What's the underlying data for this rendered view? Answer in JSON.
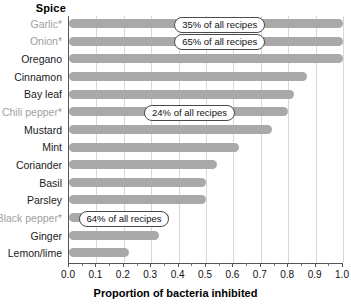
{
  "chart_data": {
    "type": "bar",
    "orientation": "horizontal",
    "title": "",
    "xlabel": "Proportion of bacteria inhibited",
    "ylabel": "Spice",
    "xlim": [
      0.0,
      1.0
    ],
    "xticks": [
      "0.0",
      "0.1",
      "0.2",
      "0.3",
      "0.4",
      "0.5",
      "0.6",
      "0.7",
      "0.8",
      "0.9",
      "1.0"
    ],
    "grid": true,
    "legend": "none",
    "bar_color": "#a9a9a9",
    "muted_label_color": "#a0a0a0",
    "categories": [
      "Garlic*",
      "Onion*",
      "Oregano",
      "Cinnamon",
      "Bay leaf",
      "Chili pepper*",
      "Mustard",
      "Mint",
      "Coriander",
      "Basil",
      "Parsley",
      "Black pepper*",
      "Ginger",
      "Lemon/lime"
    ],
    "values": [
      1.0,
      1.0,
      1.0,
      0.87,
      0.82,
      0.8,
      0.74,
      0.62,
      0.54,
      0.5,
      0.5,
      0.365,
      0.33,
      0.22
    ],
    "muted": [
      true,
      true,
      false,
      false,
      false,
      true,
      false,
      false,
      false,
      false,
      false,
      true,
      false,
      false
    ],
    "annotations": [
      {
        "category": "Garlic*",
        "text": "35% of all recipes"
      },
      {
        "category": "Onion*",
        "text": "65% of all recipes"
      },
      {
        "category": "Chili pepper*",
        "text": "24% of all recipes"
      },
      {
        "category": "Black pepper*",
        "text": "64% of all recipes"
      }
    ]
  }
}
